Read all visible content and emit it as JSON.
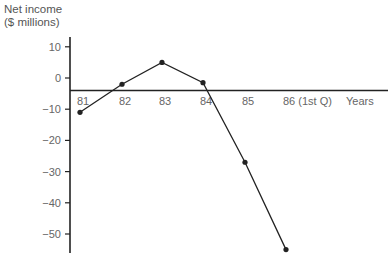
{
  "chart_data": {
    "type": "line",
    "title": "",
    "ylabel_line1": "Net income",
    "ylabel_line2": "($ millions)",
    "xlabel": "Years",
    "categories": [
      "81",
      "82",
      "83",
      "84",
      "85",
      "86 (1st Q)"
    ],
    "series": [
      {
        "name": "Net income",
        "values": [
          -11,
          -2,
          5,
          -1.5,
          -27,
          -55
        ]
      }
    ],
    "yticks": [
      10,
      0,
      -10,
      -20,
      -30,
      -40,
      -50
    ],
    "ylim": [
      -56,
      16
    ],
    "x_axis_at": -4,
    "grid": false,
    "legend": "none",
    "colors": {
      "line": "#222222",
      "axis": "#222222",
      "text": "#666666"
    }
  }
}
